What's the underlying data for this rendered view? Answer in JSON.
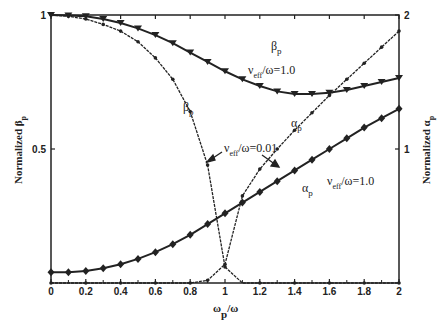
{
  "chart_data": {
    "type": "line",
    "title": "",
    "xlabel": "ω_p/ω",
    "ylabel_left": "Normalized β_p",
    "ylabel_right": "Normalized α_p",
    "xlim": [
      0,
      2
    ],
    "ylim_left": [
      0,
      1
    ],
    "ylim_right": [
      0,
      2
    ],
    "x_ticks": [
      "0",
      "0.2",
      "0.4",
      "0.6",
      "0.8",
      "1",
      "1.2",
      "1.4",
      "1.6",
      "1.8",
      "2"
    ],
    "y_ticks_left": [
      "0.5",
      "1"
    ],
    "y_ticks_right": [
      "1",
      "2"
    ],
    "grid": false,
    "x": [
      0,
      0.1,
      0.2,
      0.3,
      0.4,
      0.5,
      0.6,
      0.7,
      0.8,
      0.9,
      1.0,
      1.1,
      1.2,
      1.3,
      1.4,
      1.5,
      1.6,
      1.7,
      1.8,
      1.9,
      2.0
    ],
    "series": [
      {
        "name": "β_p, ν_eff/ω=1.0",
        "axis": "left",
        "marker": "triangle-down",
        "values": [
          1.0,
          0.998,
          0.995,
          0.985,
          0.97,
          0.95,
          0.925,
          0.895,
          0.86,
          0.825,
          0.79,
          0.76,
          0.735,
          0.715,
          0.705,
          0.705,
          0.71,
          0.72,
          0.735,
          0.75,
          0.765
        ]
      },
      {
        "name": "β_p, ν_eff/ω=0.01",
        "axis": "left",
        "marker": "dot",
        "values": [
          1.0,
          0.995,
          0.985,
          0.965,
          0.94,
          0.9,
          0.84,
          0.76,
          0.64,
          0.44,
          0.06,
          0.0,
          0.0,
          0.0,
          0.0,
          0.0,
          0.0,
          0.0,
          0.0,
          0.0,
          0.0
        ]
      },
      {
        "name": "α_p, ν_eff/ω=1.0",
        "axis": "right",
        "marker": "diamond",
        "values": [
          0.08,
          0.08,
          0.09,
          0.11,
          0.14,
          0.18,
          0.23,
          0.29,
          0.36,
          0.44,
          0.52,
          0.6,
          0.68,
          0.76,
          0.84,
          0.92,
          1.0,
          1.08,
          1.16,
          1.23,
          1.3
        ]
      },
      {
        "name": "α_p, ν_eff/ω=0.01",
        "axis": "right",
        "marker": "dot",
        "values": [
          0.0,
          0.0,
          0.0,
          0.0,
          0.0,
          0.0,
          0.0,
          0.0,
          0.0,
          0.02,
          0.14,
          0.65,
          0.85,
          1.0,
          1.14,
          1.27,
          1.4,
          1.52,
          1.64,
          1.76,
          1.88
        ]
      }
    ],
    "annotations": [
      {
        "text": "β_p",
        "near": "β_p ν=1.0 curve, x≈1.3"
      },
      {
        "text": "ν_eff/ω=1.0",
        "near": "β_p ν=1.0 curve, x≈1.4"
      },
      {
        "text": "β_p",
        "near": "β_p ν=0.01 curve, x≈0.8"
      },
      {
        "text": "ν_eff/ω=0.01",
        "near": "arrows to both ν=0.01 curves"
      },
      {
        "text": "α_p",
        "near": "α_p ν=0.01 curve, x≈1.3"
      },
      {
        "text": "α_p",
        "near": "α_p ν=1.0 curve, x≈1.5"
      },
      {
        "text": "ν_eff/ω=1.0",
        "near": "α_p ν=1.0 curve, x≈1.7"
      }
    ]
  },
  "labels": {
    "xlabel_main": "ω",
    "xlabel_sub": "p",
    "xlabel_tail": "/ω",
    "ylabel_left_main": "Normalized β",
    "ylabel_left_sub": "p",
    "ylabel_right_main": "Normalized α",
    "ylabel_right_sub": "p",
    "beta": "β",
    "alpha": "α",
    "sub_p": "p",
    "nu": "ν",
    "eff": "eff",
    "nu_one": "/ω=1.0",
    "nu_001": "/ω=0.01"
  }
}
